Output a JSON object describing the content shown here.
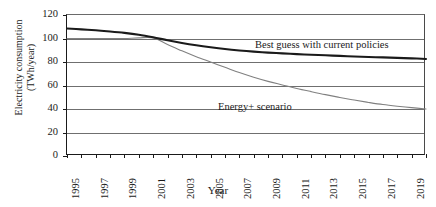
{
  "axes": {
    "ylabel_line1": "Electricity consumption",
    "ylabel_line2": "(TWh/year)",
    "xlabel": "Year",
    "yticks": [
      0,
      20,
      40,
      60,
      80,
      100,
      120
    ],
    "xticklabels": [
      "1995",
      "1997",
      "1999",
      "2001",
      "2003",
      "2005",
      "2007",
      "2009",
      "2011",
      "2013",
      "2015",
      "2017",
      "2019"
    ]
  },
  "annotations": {
    "best_guess": "Best guess with current policies",
    "energy_plus": "Energy+ scenario"
  },
  "colors": {
    "best_guess": "#1a1a1a",
    "energy_plus": "#808080",
    "grid": "#6f6f6f",
    "axis": "#1a1a1a"
  },
  "chart_data": {
    "type": "line",
    "title": "",
    "xlabel": "Year",
    "ylabel": "Electricity consumption (TWh/year)",
    "xlim": [
      1995,
      2020
    ],
    "ylim": [
      0,
      120
    ],
    "ytick_step": 20,
    "grid": true,
    "legend": "inline-annotations",
    "x": [
      1995,
      1996,
      1997,
      1998,
      1999,
      2000,
      2001,
      2002,
      2003,
      2004,
      2005,
      2006,
      2007,
      2008,
      2009,
      2010,
      2011,
      2012,
      2013,
      2014,
      2015,
      2016,
      2017,
      2018,
      2019,
      2020
    ],
    "series": [
      {
        "name": "Best guess with current policies",
        "color": "#1a1a1a",
        "values": [
          108.5,
          107.8,
          107.0,
          106.0,
          104.8,
          103.2,
          101.0,
          98.5,
          96.2,
          94.2,
          92.5,
          91.0,
          89.8,
          88.8,
          88.0,
          87.3,
          86.7,
          86.2,
          85.7,
          85.2,
          84.7,
          84.3,
          83.9,
          83.5,
          83.1,
          82.6
        ]
      },
      {
        "name": "Energy+ scenario",
        "color": "#808080",
        "values": [
          100.0,
          100.0,
          100.0,
          100.0,
          100.0,
          100.5,
          100.5,
          95.0,
          89.5,
          84.5,
          80.0,
          75.5,
          71.0,
          67.0,
          63.5,
          60.5,
          57.5,
          54.8,
          52.2,
          49.8,
          47.6,
          45.6,
          43.8,
          42.4,
          41.2,
          40.0
        ]
      }
    ]
  }
}
